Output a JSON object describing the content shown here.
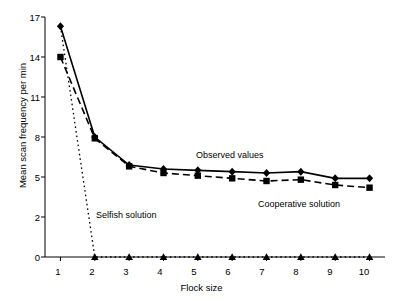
{
  "chart_data": {
    "type": "line",
    "title": "",
    "xlabel": "Flock size",
    "ylabel": "Mean scan frequency per min",
    "x": [
      1,
      2,
      3,
      4,
      5,
      6,
      7,
      8,
      9,
      10
    ],
    "xlim": [
      0.55,
      10.45
    ],
    "ylim": [
      0,
      17
    ],
    "yticks": [
      "0",
      "2",
      "5",
      "8",
      "11",
      "14",
      "17"
    ],
    "ytick_values": [
      0,
      2,
      5,
      8,
      11,
      14,
      17
    ],
    "xticks": [
      "1",
      "2",
      "3",
      "4",
      "5",
      "6",
      "7",
      "8",
      "9",
      "10"
    ],
    "grid": false,
    "legend": "none",
    "series": [
      {
        "name": "Observed values",
        "marker": "diamond",
        "line": "solid",
        "color": "#000000",
        "values": [
          16.3,
          8.0,
          5.9,
          5.6,
          5.5,
          5.4,
          5.3,
          5.4,
          4.9,
          4.9
        ]
      },
      {
        "name": "Cooperative solution",
        "marker": "square",
        "line": "dashed",
        "color": "#000000",
        "values": [
          14.0,
          7.9,
          5.8,
          5.3,
          5.1,
          4.9,
          4.7,
          4.8,
          4.4,
          4.2
        ]
      },
      {
        "name": "Selfish solution",
        "marker": "triangle",
        "line": "dotted",
        "color": "#000000",
        "values": [
          16.3,
          0.0,
          0.0,
          0.0,
          0.0,
          0.0,
          0.0,
          0.0,
          0.0,
          0.0
        ]
      }
    ],
    "annotations": [
      {
        "text": "Observed values",
        "x": 4.45,
        "y": 6.6
      },
      {
        "text": "Selfish solution",
        "x": 1.85,
        "y": 2.35
      },
      {
        "text": "Cooperative solution",
        "x": 6.15,
        "y": 3.3
      }
    ]
  }
}
